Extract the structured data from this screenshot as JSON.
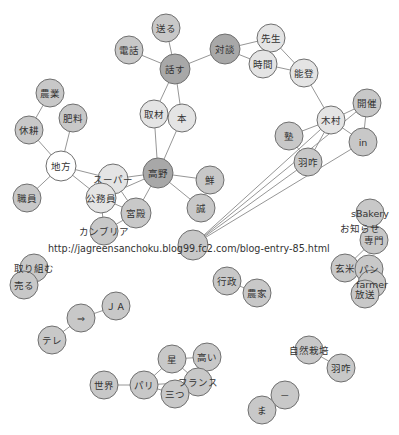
{
  "diagram": {
    "type": "co-occurrence network",
    "colors": {
      "white": "#ffffff",
      "light": "#e4e4e4",
      "medium": "#c8c8c8",
      "dark": "#a8a8a8",
      "edge": "#8a8a8a",
      "stroke": "#6f6f6f"
    },
    "url_text": "http://jagreensanchoku.blog99.fc2.com/blog-entry-85.html",
    "nodes": [
      {
        "id": "okuru",
        "label": "送る",
        "x": 166,
        "y": 28,
        "r": 14,
        "fill": "medium"
      },
      {
        "id": "denwa",
        "label": "電話",
        "x": 129,
        "y": 50,
        "r": 14,
        "fill": "medium"
      },
      {
        "id": "hanasu",
        "label": "話す",
        "x": 175,
        "y": 69,
        "r": 15,
        "fill": "dark"
      },
      {
        "id": "taidan",
        "label": "対談",
        "x": 225,
        "y": 49,
        "r": 15,
        "fill": "dark"
      },
      {
        "id": "sensei",
        "label": "先生",
        "x": 271,
        "y": 38,
        "r": 14,
        "fill": "light"
      },
      {
        "id": "jikan",
        "label": "時間",
        "x": 263,
        "y": 64,
        "r": 14,
        "fill": "light"
      },
      {
        "id": "noto",
        "label": "能登",
        "x": 304,
        "y": 73,
        "r": 14,
        "fill": "light"
      },
      {
        "id": "shuzai",
        "label": "取材",
        "x": 154,
        "y": 114,
        "r": 14,
        "fill": "light"
      },
      {
        "id": "hon",
        "label": "本",
        "x": 182,
        "y": 118,
        "r": 14,
        "fill": "light"
      },
      {
        "id": "kaisai",
        "label": "開催",
        "x": 367,
        "y": 103,
        "r": 14,
        "fill": "medium"
      },
      {
        "id": "kimura",
        "label": "木村",
        "x": 331,
        "y": 120,
        "r": 14,
        "fill": "light"
      },
      {
        "id": "juku",
        "label": "塾",
        "x": 289,
        "y": 136,
        "r": 14,
        "fill": "medium"
      },
      {
        "id": "in",
        "label": "in",
        "x": 363,
        "y": 142,
        "r": 14,
        "fill": "medium"
      },
      {
        "id": "hakui1",
        "label": "羽咋",
        "x": 308,
        "y": 162,
        "r": 14,
        "fill": "medium"
      },
      {
        "id": "nougyou",
        "label": "農業",
        "x": 50,
        "y": 93,
        "r": 14,
        "fill": "medium"
      },
      {
        "id": "hiryou",
        "label": "肥料",
        "x": 73,
        "y": 118,
        "r": 14,
        "fill": "medium"
      },
      {
        "id": "kyuukou",
        "label": "休耕",
        "x": 29,
        "y": 130,
        "r": 14,
        "fill": "medium"
      },
      {
        "id": "chihou",
        "label": "地方",
        "x": 61,
        "y": 166,
        "r": 15,
        "fill": "white"
      },
      {
        "id": "shokuin",
        "label": "職員",
        "x": 27,
        "y": 198,
        "r": 14,
        "fill": "medium"
      },
      {
        "id": "super",
        "label": "スーパー",
        "x": 113,
        "y": 179,
        "r": 15,
        "fill": "light"
      },
      {
        "id": "koumuin",
        "label": "公務員",
        "x": 101,
        "y": 198,
        "r": 15,
        "fill": "light"
      },
      {
        "id": "kouya",
        "label": "高野",
        "x": 158,
        "y": 173,
        "r": 15,
        "fill": "dark"
      },
      {
        "id": "sen",
        "label": "鮮",
        "x": 210,
        "y": 180,
        "r": 14,
        "fill": "medium"
      },
      {
        "id": "makoto",
        "label": "誠",
        "x": 201,
        "y": 208,
        "r": 14,
        "fill": "medium"
      },
      {
        "id": "kyuuden",
        "label": "宮殿",
        "x": 136,
        "y": 213,
        "r": 15,
        "fill": "medium"
      },
      {
        "id": "cambria",
        "label": "カンブリア",
        "x": 104,
        "y": 231,
        "r": 14,
        "fill": "medium"
      },
      {
        "id": "url",
        "label": "",
        "x": 193,
        "y": 245,
        "r": 15,
        "fill": "medium"
      },
      {
        "id": "sbakery",
        "label": "sBakery",
        "x": 370,
        "y": 213,
        "r": 14,
        "fill": "medium"
      },
      {
        "id": "oshirase",
        "label": "お知らせ",
        "x": 360,
        "y": 228,
        "r": 0,
        "fill": "none"
      },
      {
        "id": "senmon",
        "label": "専門",
        "x": 374,
        "y": 240,
        "r": 14,
        "fill": "medium"
      },
      {
        "id": "genmai",
        "label": "玄米",
        "x": 345,
        "y": 268,
        "r": 14,
        "fill": "medium"
      },
      {
        "id": "pan",
        "label": "パン",
        "x": 369,
        "y": 269,
        "r": 14,
        "fill": "medium"
      },
      {
        "id": "farmer",
        "label": "farmer",
        "x": 372,
        "y": 284,
        "r": 14,
        "fill": "medium"
      },
      {
        "id": "housou",
        "label": "放送",
        "x": 365,
        "y": 294,
        "r": 14,
        "fill": "medium"
      },
      {
        "id": "torikumu",
        "label": "取り組む",
        "x": 34,
        "y": 268,
        "r": 14,
        "fill": "medium"
      },
      {
        "id": "uru",
        "label": "売る",
        "x": 24,
        "y": 285,
        "r": 14,
        "fill": "medium"
      },
      {
        "id": "gyousei",
        "label": "行政",
        "x": 227,
        "y": 281,
        "r": 14,
        "fill": "medium"
      },
      {
        "id": "nouka",
        "label": "農家",
        "x": 257,
        "y": 293,
        "r": 14,
        "fill": "medium"
      },
      {
        "id": "ja",
        "label": "ＪＡ",
        "x": 116,
        "y": 306,
        "r": 14,
        "fill": "medium"
      },
      {
        "id": "arrow",
        "label": "⇒",
        "x": 81,
        "y": 318,
        "r": 14,
        "fill": "medium"
      },
      {
        "id": "tere",
        "label": "テレ",
        "x": 52,
        "y": 340,
        "r": 14,
        "fill": "medium"
      },
      {
        "id": "hoshi",
        "label": "星",
        "x": 172,
        "y": 359,
        "r": 14,
        "fill": "medium"
      },
      {
        "id": "takai",
        "label": "高い",
        "x": 207,
        "y": 357,
        "r": 14,
        "fill": "medium"
      },
      {
        "id": "sekai",
        "label": "世界",
        "x": 104,
        "y": 385,
        "r": 14,
        "fill": "medium"
      },
      {
        "id": "pari",
        "label": "パリ",
        "x": 144,
        "y": 385,
        "r": 14,
        "fill": "medium"
      },
      {
        "id": "france",
        "label": "フランス",
        "x": 198,
        "y": 382,
        "r": 14,
        "fill": "medium"
      },
      {
        "id": "mittsu",
        "label": "三つ",
        "x": 175,
        "y": 394,
        "r": 14,
        "fill": "medium"
      },
      {
        "id": "shizensaibai",
        "label": "自然栽培",
        "x": 309,
        "y": 350,
        "r": 14,
        "fill": "medium"
      },
      {
        "id": "hakui2",
        "label": "羽咋",
        "x": 341,
        "y": 368,
        "r": 14,
        "fill": "medium"
      },
      {
        "id": "dash",
        "label": "－",
        "x": 285,
        "y": 395,
        "r": 14,
        "fill": "medium"
      },
      {
        "id": "ma",
        "label": "ま",
        "x": 262,
        "y": 410,
        "r": 14,
        "fill": "medium"
      }
    ],
    "edges": [
      [
        "okuru",
        "hanasu"
      ],
      [
        "denwa",
        "hanasu"
      ],
      [
        "hanasu",
        "taidan"
      ],
      [
        "hanasu",
        "shuzai"
      ],
      [
        "hanasu",
        "hon"
      ],
      [
        "taidan",
        "sensei"
      ],
      [
        "taidan",
        "jikan"
      ],
      [
        "sensei",
        "jikan"
      ],
      [
        "sensei",
        "noto"
      ],
      [
        "jikan",
        "noto"
      ],
      [
        "noto",
        "kimura"
      ],
      [
        "kimura",
        "kaisai"
      ],
      [
        "kimura",
        "juku"
      ],
      [
        "kimura",
        "in"
      ],
      [
        "kimura",
        "hakui1"
      ],
      [
        "kaisai",
        "in"
      ],
      [
        "juku",
        "hakui1"
      ],
      [
        "url",
        "kimura"
      ],
      [
        "url",
        "kaisai"
      ],
      [
        "url",
        "in"
      ],
      [
        "url",
        "hakui1"
      ],
      [
        "shuzai",
        "kouya"
      ],
      [
        "hon",
        "kouya"
      ],
      [
        "shuzai",
        "hon"
      ],
      [
        "nougyou",
        "kyuukou"
      ],
      [
        "hiryou",
        "chihou"
      ],
      [
        "kyuukou",
        "chihou"
      ],
      [
        "chihou",
        "shokuin"
      ],
      [
        "chihou",
        "super"
      ],
      [
        "chihou",
        "koumuin"
      ],
      [
        "super",
        "kouya"
      ],
      [
        "koumuin",
        "kouya"
      ],
      [
        "super",
        "koumuin"
      ],
      [
        "super",
        "kyuuden"
      ],
      [
        "koumuin",
        "kyuuden"
      ],
      [
        "koumuin",
        "cambria"
      ],
      [
        "kyuuden",
        "cambria"
      ],
      [
        "kouya",
        "kyuuden"
      ],
      [
        "kouya",
        "sen"
      ],
      [
        "kouya",
        "makoto"
      ],
      [
        "sbakery",
        "senmon"
      ],
      [
        "senmon",
        "genmai"
      ],
      [
        "genmai",
        "pan"
      ],
      [
        "pan",
        "farmer"
      ],
      [
        "farmer",
        "housou"
      ],
      [
        "pan",
        "housou"
      ],
      [
        "torikumu",
        "uru"
      ],
      [
        "gyousei",
        "nouka"
      ],
      [
        "ja",
        "arrow"
      ],
      [
        "arrow",
        "tere"
      ],
      [
        "hoshi",
        "takai"
      ],
      [
        "hoshi",
        "pari"
      ],
      [
        "hoshi",
        "france"
      ],
      [
        "sekai",
        "pari"
      ],
      [
        "pari",
        "mittsu"
      ],
      [
        "pari",
        "france"
      ],
      [
        "france",
        "mittsu"
      ],
      [
        "takai",
        "france"
      ],
      [
        "shizensaibai",
        "hakui2"
      ],
      [
        "dash",
        "ma"
      ]
    ]
  }
}
